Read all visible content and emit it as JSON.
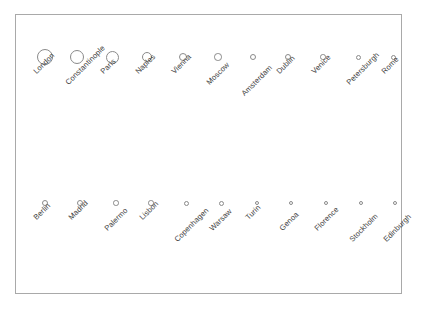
{
  "figure": {
    "title": "",
    "background_color": "#ffffff",
    "frame_color": "#a9a9a9",
    "bubble_stroke_color": "#8a8a8a",
    "label_color": "#3d3d3d",
    "label_rotation_deg": -45
  },
  "chart_data": {
    "type": "scatter",
    "title": "",
    "subtitle": "",
    "xlabel": "",
    "ylabel": "",
    "legend": [],
    "grid": false,
    "note": "Proportional-symbol (bubble) chart: 22 European cities drawn as open circles arranged in two rows, symbol size decreasing from left to right; each circle labelled with a 45-degree rotated city name.",
    "rows": [
      {
        "row": "top",
        "categories": [
          "London",
          "Constantinople",
          "Paris",
          "Naples",
          "Vienna",
          "Moscow",
          "Amsterdam",
          "Dublin",
          "Venice",
          "Petersburgh",
          "Rome"
        ],
        "values": [
          16,
          14.5,
          13,
          10.5,
          8.5,
          7.5,
          6.5,
          6,
          5.5,
          5,
          5
        ]
      },
      {
        "row": "bottom",
        "categories": [
          "Berlin",
          "Madrid",
          "Palermo",
          "Lisbon",
          "Copenhagen",
          "Warsaw",
          "Turin",
          "Genoa",
          "Florence",
          "Stockholm",
          "Edinburgh"
        ],
        "values": [
          6,
          6,
          5.5,
          5.5,
          5,
          5,
          4.5,
          4.5,
          4.5,
          4,
          4
        ]
      }
    ],
    "points": [
      {
        "label": "London",
        "row": "top",
        "cx": 44,
        "cy": 56,
        "d": 16.0,
        "label_tier": 0
      },
      {
        "label": "Constantinople",
        "row": "top",
        "cx": 76,
        "cy": 56,
        "d": 14.5,
        "label_tier": 1
      },
      {
        "label": "Paris",
        "row": "top",
        "cx": 111,
        "cy": 56,
        "d": 13.0,
        "label_tier": 0
      },
      {
        "label": "Naples",
        "row": "top",
        "cx": 146,
        "cy": 56,
        "d": 10.5,
        "label_tier": 0
      },
      {
        "label": "Vienna",
        "row": "top",
        "cx": 182,
        "cy": 56,
        "d": 8.5,
        "label_tier": 0
      },
      {
        "label": "Moscow",
        "row": "top",
        "cx": 217,
        "cy": 56,
        "d": 7.5,
        "label_tier": 1
      },
      {
        "label": "Amsterdam",
        "row": "top",
        "cx": 252,
        "cy": 56,
        "d": 6.5,
        "label_tier": 2
      },
      {
        "label": "Dublin",
        "row": "top",
        "cx": 287,
        "cy": 56,
        "d": 6.0,
        "label_tier": 0
      },
      {
        "label": "Venice",
        "row": "top",
        "cx": 322,
        "cy": 56,
        "d": 5.5,
        "label_tier": 0
      },
      {
        "label": "Petersburgh",
        "row": "top",
        "cx": 357,
        "cy": 56,
        "d": 5.0,
        "label_tier": 1
      },
      {
        "label": "Rome",
        "row": "top",
        "cx": 392,
        "cy": 56,
        "d": 5.0,
        "label_tier": 0
      },
      {
        "label": "Berlin",
        "row": "bottom",
        "cx": 44,
        "cy": 202,
        "d": 6.0,
        "label_tier": 0
      },
      {
        "label": "Madrid",
        "row": "bottom",
        "cx": 79,
        "cy": 202,
        "d": 6.0,
        "label_tier": 0
      },
      {
        "label": "Palermo",
        "row": "bottom",
        "cx": 115,
        "cy": 202,
        "d": 5.5,
        "label_tier": 1
      },
      {
        "label": "Lisbon",
        "row": "bottom",
        "cx": 150,
        "cy": 202,
        "d": 5.5,
        "label_tier": 0
      },
      {
        "label": "Copenhagen",
        "row": "bottom",
        "cx": 185,
        "cy": 202,
        "d": 5.0,
        "label_tier": 2
      },
      {
        "label": "Warsaw",
        "row": "bottom",
        "cx": 220,
        "cy": 202,
        "d": 5.0,
        "label_tier": 1
      },
      {
        "label": "Turin",
        "row": "bottom",
        "cx": 256,
        "cy": 202,
        "d": 4.5,
        "label_tier": 0
      },
      {
        "label": "Genoa",
        "row": "bottom",
        "cx": 290,
        "cy": 202,
        "d": 4.5,
        "label_tier": 1
      },
      {
        "label": "Florence",
        "row": "bottom",
        "cx": 325,
        "cy": 202,
        "d": 4.5,
        "label_tier": 1
      },
      {
        "label": "Stockholm",
        "row": "bottom",
        "cx": 360,
        "cy": 202,
        "d": 4.0,
        "label_tier": 2
      },
      {
        "label": "Edinburgh",
        "row": "bottom",
        "cx": 394,
        "cy": 202,
        "d": 4.0,
        "label_tier": 2
      }
    ]
  }
}
